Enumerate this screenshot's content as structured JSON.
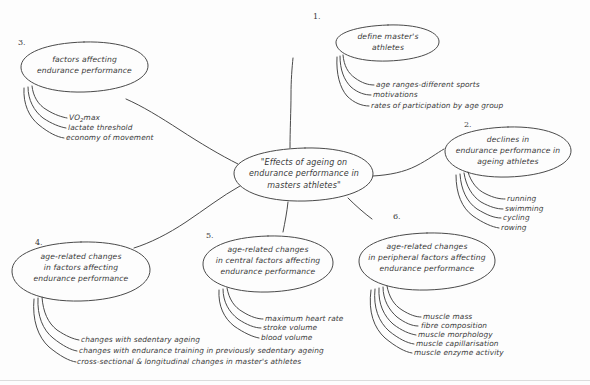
{
  "diagram": {
    "title_central": "\"Effects of ageing on\nendurance performance in\nmasters athletes\"",
    "style": {
      "ink": "#4a4a4a",
      "text": "#3a3a3a",
      "background": "#fdfdfd"
    },
    "nodes": [
      {
        "number": "1.",
        "label": "define master's\nathletes",
        "leaves": [
          "age ranges-different sports",
          "motivations",
          "rates of participation by age group"
        ]
      },
      {
        "number": "2.",
        "label": "declines in\nendurance performance in\nageing athletes",
        "leaves": [
          "running",
          "swimming",
          "cycling",
          "rowing"
        ]
      },
      {
        "number": "3.",
        "label": "factors affecting\nendurance performance",
        "leaves": [
          "VO2max",
          "lactate threshold",
          "economy of movement"
        ]
      },
      {
        "number": "4.",
        "label": "age-related changes\nin factors affecting\nendurance performance",
        "leaves": [
          "changes with sedentary ageing",
          "changes with endurance training in previously sedentary ageing",
          "cross-sectional & longitudinal changes in master's athletes"
        ]
      },
      {
        "number": "5.",
        "label": "age-related changes\nin central factors affecting\nendurance performance",
        "leaves": [
          "maximum heart rate",
          "stroke volume",
          "blood volume"
        ]
      },
      {
        "number": "6.",
        "label": "age-related changes\nin peripheral factors affecting\nendurance performance",
        "leaves": [
          "muscle mass",
          "fibre composition",
          "muscle morphology",
          "muscle capillarisation",
          "muscle enzyme activity"
        ]
      }
    ]
  }
}
